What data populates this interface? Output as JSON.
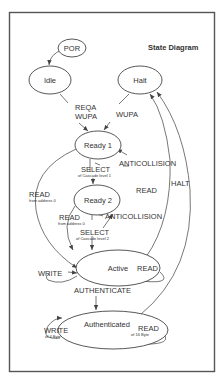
{
  "diagram": {
    "title": "State Diagram",
    "states": [
      {
        "id": "por",
        "label": "POR"
      },
      {
        "id": "idle",
        "label": "Idle"
      },
      {
        "id": "halt",
        "label": "Halt"
      },
      {
        "id": "ready1",
        "label": "Ready 1"
      },
      {
        "id": "ready2",
        "label": "Ready 2"
      },
      {
        "id": "active",
        "label": "Active"
      },
      {
        "id": "authenticated",
        "label": "Authenticated"
      }
    ],
    "transitions": {
      "idle_to_ready1": {
        "line1": "REQA",
        "line2": "WUPA"
      },
      "halt_to_ready1": {
        "label": "WUPA"
      },
      "ready1_anticollision": {
        "label": "ANTICOLLISION"
      },
      "ready1_select": {
        "label": "SELECT",
        "sub": "of Cascade level 1"
      },
      "ready1_read": {
        "label": "READ",
        "sub": "from address 0"
      },
      "ready2_read_right": {
        "label": "READ"
      },
      "ready2_read": {
        "label": "READ",
        "sub": "from address 0"
      },
      "ready2_anticollision": {
        "label": "ANTICOLLISION"
      },
      "ready2_select": {
        "label": "SELECT",
        "sub": "of Cascade level  2"
      },
      "halt": {
        "label": "HALT"
      },
      "active_write": {
        "label": "WRITE"
      },
      "active_read": {
        "label": "READ"
      },
      "authenticate": {
        "label": "AUTHENTICATE"
      },
      "auth_write": {
        "label": "WRITE",
        "sub": "of 4 Byte"
      },
      "auth_read": {
        "label": "READ",
        "sub": "of  16 Byte"
      }
    }
  }
}
